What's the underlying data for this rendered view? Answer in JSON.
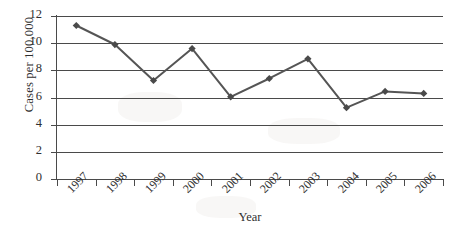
{
  "chart_data": {
    "type": "line",
    "title": "",
    "subtitle": "",
    "xlabel": "Year",
    "ylabel": "Cases per 100,000",
    "categories": [
      "1997",
      "1998",
      "1999",
      "2000",
      "2001",
      "2002",
      "2003",
      "2004",
      "2005",
      "2006"
    ],
    "values": [
      11.3,
      9.9,
      7.25,
      9.6,
      6.05,
      7.4,
      8.85,
      5.25,
      6.45,
      6.3
    ],
    "series": [
      {
        "name": "Cases per 100,000",
        "values": [
          11.3,
          9.9,
          7.25,
          9.6,
          6.05,
          7.4,
          8.85,
          5.25,
          6.45,
          6.3
        ]
      }
    ],
    "ylim": [
      0,
      12
    ],
    "ytick_labels": [
      "12",
      "10",
      "8",
      "6",
      "4",
      "2",
      "0"
    ],
    "ytick_values": [
      12,
      10,
      8,
      6,
      4,
      2,
      0
    ],
    "ytick_interval": 2,
    "grid": "horizontal",
    "legend": "none",
    "marker": "diamond",
    "line_color": "#555555",
    "marker_color": "#4a4a4a",
    "grid_color": "#4a4a4a",
    "axis_color": "#4a4a4a",
    "background_color": "#ffffff",
    "xtick_label_rotation": -45
  }
}
